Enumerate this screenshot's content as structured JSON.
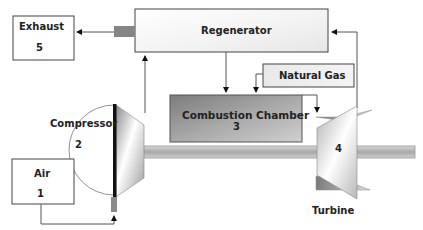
{
  "diagram": {
    "type": "gas turbine with regenerator schematic",
    "components": {
      "exhaust": {
        "label": "Exhaust",
        "number": "5"
      },
      "regenerator": {
        "label": "Regenerator"
      },
      "natural_gas": {
        "label": "Natural Gas"
      },
      "combustion_chamber": {
        "label": "Combustion Chamber",
        "number": "3"
      },
      "compressor": {
        "label": "Compressor",
        "number": "2"
      },
      "turbine": {
        "label": "Turbine",
        "number": "4"
      },
      "air": {
        "label": "Air",
        "number": "1"
      }
    },
    "flows": [
      {
        "from": "air",
        "to": "compressor"
      },
      {
        "from": "compressor",
        "to": "regenerator"
      },
      {
        "from": "regenerator",
        "to": "combustion_chamber"
      },
      {
        "from": "natural_gas",
        "to": "combustion_chamber"
      },
      {
        "from": "combustion_chamber",
        "to": "turbine"
      },
      {
        "from": "turbine",
        "to": "regenerator"
      },
      {
        "from": "regenerator",
        "to": "exhaust"
      }
    ],
    "colors": {
      "line": "#555555",
      "chamber_dark": "#8a8a8a",
      "chamber_light": "#c8c8c8",
      "shaft": "#b5b5b5",
      "compressor_blade": "#111111"
    }
  }
}
